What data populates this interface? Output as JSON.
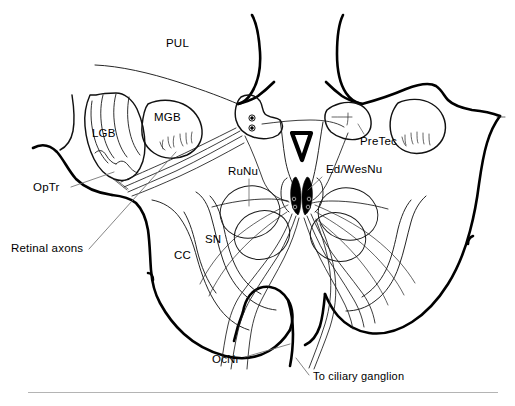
{
  "figure": {
    "background_color": "#ffffff",
    "line_color": "#000000",
    "leader_color": "#6f6f6f",
    "rule_color": "#b4b4b4",
    "width": 515,
    "height": 406
  },
  "labels": {
    "pul": "PUL",
    "mgb": "MGB",
    "lgb": "LGB",
    "optr": "OpTr",
    "retinal_axons": "Retinal axons",
    "runu": "RuNu",
    "sn": "SN",
    "cc": "CC",
    "pretec": "PreTec",
    "ed_wesnu": "Ed/WesNu",
    "ocnr": "OcNr",
    "to_ciliary_ganglion": "To ciliary ganglion"
  },
  "structures": [
    {
      "abbr": "PUL",
      "name": "Pulvinar",
      "label_x": 166,
      "label_y": 44,
      "has_leader": false
    },
    {
      "abbr": "MGB",
      "name": "Medial geniculate body",
      "label_x": 154,
      "label_y": 113,
      "has_leader": false
    },
    {
      "abbr": "LGB",
      "name": "Lateral geniculate body",
      "label_x": 92,
      "label_y": 132,
      "has_leader": false
    },
    {
      "abbr": "OpTr",
      "name": "Optic tract",
      "label_x": 36,
      "label_y": 189,
      "has_leader": true
    },
    {
      "abbr": "Retinal axons",
      "name": "Retinal axons",
      "label_x": 11,
      "label_y": 251,
      "has_leader": true
    },
    {
      "abbr": "RuNu",
      "name": "Red nucleus",
      "label_x": 226,
      "label_y": 171,
      "has_leader": true
    },
    {
      "abbr": "SN",
      "name": "Substantia nigra",
      "label_x": 205,
      "label_y": 239,
      "has_leader": false
    },
    {
      "abbr": "CC",
      "name": "Crus cerebri",
      "label_x": 175,
      "label_y": 255,
      "has_leader": false
    },
    {
      "abbr": "PreTec",
      "name": "Pretectal nucleus",
      "label_x": 360,
      "label_y": 140,
      "has_leader": true
    },
    {
      "abbr": "Ed/WesNu",
      "name": "Edinger-Westphal nucleus",
      "label_x": 325,
      "label_y": 168,
      "has_leader": true
    },
    {
      "abbr": "OcNr",
      "name": "Oculomotor nerve",
      "label_x": 213,
      "label_y": 360,
      "has_leader": true
    },
    {
      "abbr": "To ciliary ganglion",
      "name": "To ciliary ganglion",
      "label_x": 311,
      "label_y": 377,
      "has_leader": true
    }
  ]
}
